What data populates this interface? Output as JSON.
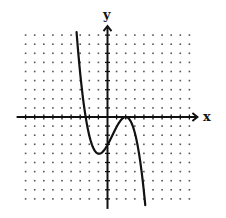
{
  "chart_data": {
    "type": "line",
    "title": "",
    "xlabel": "x",
    "ylabel": "y",
    "xlim": [
      -9,
      9
    ],
    "ylim": [
      -9,
      9
    ],
    "grid": "dotted",
    "grid_step": 1,
    "tick_marks_on_axes": true,
    "tick_labels": false,
    "legend": null,
    "series": [
      {
        "name": "cubic polynomial",
        "formula": "y = -0.32 (x - 2)^2 (x + 2.4)",
        "x_domain": [
          -3.4,
          4.15
        ],
        "key_points": {
          "x_intercepts": [
            -2.4,
            2
          ],
          "double_root": 2,
          "local_min": [
            -1,
            -4.1
          ],
          "local_max": [
            2,
            0
          ],
          "y_intercept": -3.1
        },
        "x": [
          -3.4,
          -3.0,
          -2.4,
          -2.0,
          -1.5,
          -1.0,
          -0.5,
          0,
          0.5,
          1.0,
          1.5,
          2.0,
          2.5,
          3.0,
          3.5,
          4.0,
          4.15
        ],
        "values": [
          9.4,
          5.0,
          0.0,
          -2.6,
          -3.8,
          -4.1,
          -3.9,
          -3.1,
          -2.1,
          -1.1,
          -0.3,
          0.0,
          -0.4,
          -1.7,
          -4.2,
          -8.1,
          -9.5
        ]
      }
    ],
    "colors": {
      "curve": "#111111",
      "axes": "#111111",
      "grid_dots": "#555555",
      "background": "#ffffff"
    }
  },
  "layout": {
    "origin_px": [
      107.5,
      117
    ],
    "unit_px": 9.1
  },
  "labels": {
    "x_axis": "x",
    "y_axis": "y"
  }
}
